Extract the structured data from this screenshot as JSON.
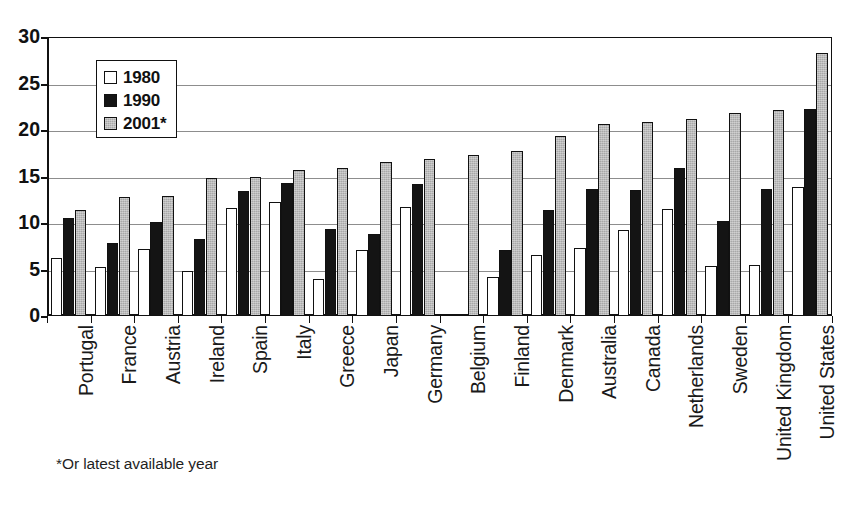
{
  "chart_data": {
    "type": "bar",
    "title": "",
    "subtitle": "",
    "xlabel": "",
    "ylabel": "",
    "ylim": [
      0,
      30
    ],
    "ytick_step": 5,
    "yticks": [
      "0",
      "5",
      "10",
      "15",
      "20",
      "25",
      "30"
    ],
    "grid": "horizontal",
    "legend_position": "inside-top-left",
    "footnote": "*Or latest available year",
    "categories": [
      "Portugal",
      "France",
      "Austria",
      "Ireland",
      "Spain",
      "Italy",
      "Greece",
      "Japan",
      "Germany",
      "Belgium",
      "Finland",
      "Denmark",
      "Australia",
      "Canada",
      "Netherlands",
      "Sweden",
      "United Kingdom",
      "United States"
    ],
    "series": [
      {
        "name": "1980",
        "color": "#ffffff",
        "values": [
          6.2,
          5.3,
          7.2,
          4.8,
          11.6,
          12.3,
          4.0,
          7.1,
          11.7,
          null,
          4.2,
          6.6,
          7.3,
          9.3,
          11.5,
          5.4,
          5.5,
          13.9
        ]
      },
      {
        "name": "1990",
        "color": "#141414",
        "values": [
          10.5,
          7.8,
          10.1,
          8.3,
          13.4,
          14.3,
          9.4,
          8.8,
          14.2,
          null,
          7.1,
          11.4,
          13.7,
          13.5,
          15.9,
          10.2,
          13.7,
          22.3
        ]
      },
      {
        "name": "2001*",
        "color": "#a8a8a8",
        "values": [
          11.4,
          12.8,
          12.9,
          14.8,
          15.0,
          15.7,
          15.9,
          16.6,
          16.9,
          17.3,
          17.7,
          19.4,
          20.6,
          20.9,
          21.2,
          21.8,
          22.1,
          28.3
        ]
      }
    ]
  },
  "legend": {
    "items": [
      {
        "label": "1980",
        "swatch": "s1980"
      },
      {
        "label": "1990",
        "swatch": "s1990"
      },
      {
        "label": "2001*",
        "swatch": "s2001"
      }
    ]
  },
  "footnote": {
    "text": "*Or latest available year"
  }
}
